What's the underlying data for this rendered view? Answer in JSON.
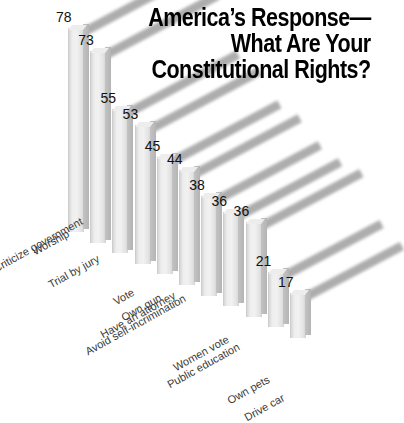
{
  "chart_data": {
    "type": "bar",
    "title_lines": [
      "America’s Response—",
      "What Are Your",
      "Constitutional Rights?"
    ],
    "xlabel": "",
    "ylabel": "",
    "ylim": [
      0,
      78
    ],
    "grid": false,
    "legend": "none",
    "value_suffix": "",
    "categories": [
      "Worship",
      "Criticize government",
      "Trial by jury",
      "Vote",
      "Own gun",
      "Have an attorney",
      "Avoid self-incrimination",
      "Women vote",
      "Public education",
      "Own pets",
      "Drive car"
    ],
    "values": [
      78,
      73,
      55,
      53,
      45,
      44,
      38,
      36,
      36,
      21,
      17
    ],
    "colors": {
      "background": "#ffffff",
      "bar_front": "#ececec",
      "bar_side": "#bcbcbc",
      "bar_top": "#a9a9a9",
      "value_text": "#111111",
      "category_text": "#3b3b3b",
      "title_text": "#000000"
    }
  }
}
